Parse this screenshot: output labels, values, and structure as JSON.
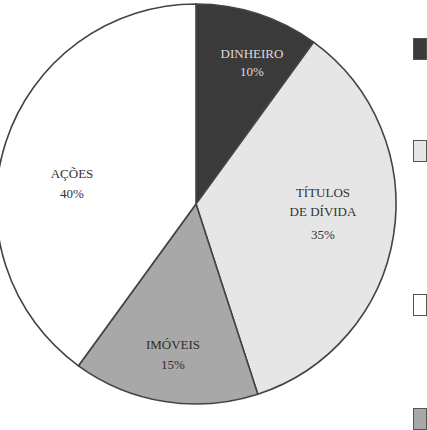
{
  "chart_data": {
    "type": "pie",
    "title": "",
    "start_angle_deg": 0,
    "direction": "clockwise",
    "slices": [
      {
        "label": "DINHEIRO",
        "value": 10,
        "display": "10%",
        "color": "#3a3a3a",
        "text_color": "#dcdcdc"
      },
      {
        "label": "TÍTULOS DE DÍVIDA",
        "label_lines": [
          "TÍTULOS",
          "DE DÍVIDA"
        ],
        "value": 35,
        "display": "35%",
        "color": "#e6e6e6",
        "text_color": "#333333"
      },
      {
        "label": "IMÓVEIS",
        "value": 15,
        "display": "15%",
        "color": "#a8a8a8",
        "text_color": "#2e2e2e"
      },
      {
        "label": "AÇÕES",
        "value": 40,
        "display": "40%",
        "color": "#ffffff",
        "text_color": "#333333"
      }
    ],
    "legend": {
      "position": "right (cropped)",
      "swatch_colors": [
        "#3a3a3a",
        "#e6e6e6",
        "#ffffff",
        "#a8a8a8"
      ]
    }
  },
  "labels": {
    "dinheiro": {
      "name": "DINHEIRO",
      "pct": "10%"
    },
    "titulos": {
      "line1": "TÍTULOS",
      "line2": "DE DÍVIDA",
      "pct": "35%"
    },
    "imoveis": {
      "name": "IMÓVEIS",
      "pct": "15%"
    },
    "acoes": {
      "name": "AÇÕES",
      "pct": "40%"
    }
  }
}
